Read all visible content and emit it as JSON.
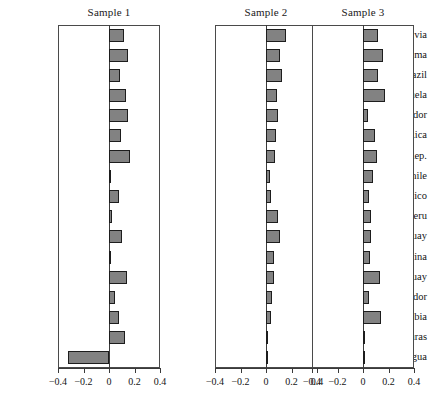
{
  "chart_data": {
    "type": "bar",
    "orientation": "horizontal",
    "title": "",
    "xlabel": "",
    "ylabel": "",
    "xlim": [
      -0.4,
      0.4
    ],
    "xticks": [
      -0.4,
      -0.2,
      0,
      0.2,
      0.4
    ],
    "xtick_labels": [
      "−0.4",
      "−0.2",
      "0",
      "0.2",
      "0.4"
    ],
    "grid": false,
    "legend": "none",
    "panel_titles": [
      "Sample 1",
      "Sample 2",
      "Sample 3"
    ],
    "categories": [
      "Bolivia",
      "Panama",
      "Brazil",
      "Venezuela",
      "El Salvador",
      "Costa Rica",
      "Dom. Rep.",
      "Chile",
      "Mexico",
      "Peru",
      "Uruguay",
      "Argentina",
      "Paraguay",
      "Ecuador",
      "Colombia",
      "Honduras",
      "Nicaragua"
    ],
    "series": [
      {
        "name": "Sample 1",
        "values": [
          0.115,
          0.15,
          0.085,
          0.135,
          0.15,
          0.095,
          0.165,
          0.01,
          0.075,
          0.025,
          0.105,
          0.005,
          0.14,
          0.05,
          0.08,
          0.125,
          -0.32
        ]
      },
      {
        "name": "Sample 2",
        "values": [
          0.155,
          0.11,
          0.125,
          0.085,
          0.095,
          0.08,
          0.07,
          0.035,
          0.04,
          0.095,
          0.11,
          0.06,
          0.065,
          0.05,
          0.04,
          0.012,
          0.01
        ]
      },
      {
        "name": "Sample 3",
        "values": [
          0.115,
          0.155,
          0.12,
          0.17,
          0.04,
          0.095,
          0.11,
          0.075,
          0.05,
          0.065,
          0.06,
          0.055,
          0.13,
          0.045,
          0.14,
          0.012,
          0.01
        ]
      }
    ],
    "bar_color": "#828282",
    "bar_edge_color": "#1d1d1d",
    "panel_border_color": "#4a4a4a",
    "background_color": "#ffffff"
  }
}
